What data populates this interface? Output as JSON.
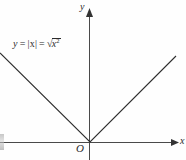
{
  "figure": {
    "kind": "cartesian-plot",
    "background_color": "#fefefe",
    "line_color": "#2e2e2e",
    "axis_color": "#4a4a4a",
    "text_color": "#2b2b2b",
    "width": 186,
    "height": 160
  },
  "labels": {
    "y_axis": "y",
    "x_axis": "x",
    "origin": "O",
    "equation_y": "y",
    "equation_eq1": "=",
    "equation_abs": "|x|",
    "equation_eq2": "=",
    "equation_radical_symbol": "√",
    "equation_radical_arg": "x",
    "equation_radical_exp": "2",
    "equation_full": "y = |x| = √x²"
  },
  "chart_data": {
    "type": "line",
    "title": "",
    "subtitle": "",
    "xlabel": "x",
    "ylabel": "y",
    "annotations": [
      "y = |x| = √x²",
      "O"
    ],
    "grid": false,
    "legend": null,
    "axis_arrows": {
      "x_positive": true,
      "y_positive": true
    },
    "origin_px": {
      "x": 90,
      "y": 142
    },
    "xlim": [
      -90,
      96
    ],
    "ylim": [
      -18,
      142
    ],
    "series": [
      {
        "name": "y = |x|",
        "equation": "y = |x| = sqrt(x^2)",
        "x": [
          -90,
          0,
          86
        ],
        "values": [
          90,
          0,
          86
        ],
        "points_px": [
          {
            "x": 0,
            "y": 53
          },
          {
            "x": 90,
            "y": 142
          },
          {
            "x": 176,
            "y": 56
          }
        ]
      }
    ]
  }
}
